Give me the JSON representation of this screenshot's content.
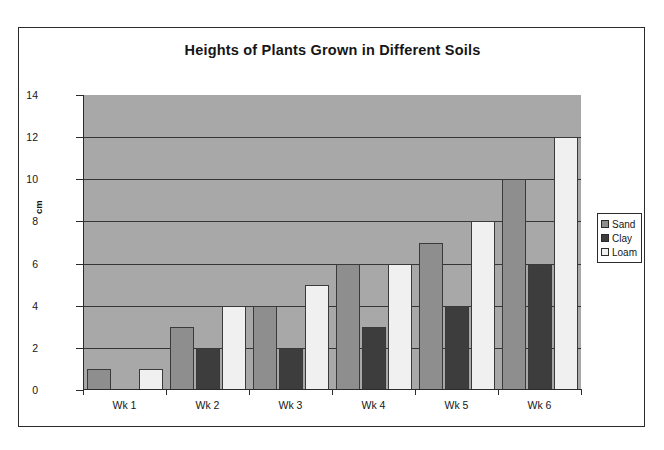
{
  "chart_data": {
    "type": "bar",
    "title": "Heights of Plants Grown in Different Soils",
    "xlabel": "",
    "ylabel": "cm",
    "categories": [
      "Wk 1",
      "Wk 2",
      "Wk 3",
      "Wk 4",
      "Wk 5",
      "Wk 6"
    ],
    "series": [
      {
        "name": "Sand",
        "color": "#8e8e8e",
        "values": [
          1,
          3,
          4,
          6,
          7,
          10
        ]
      },
      {
        "name": "Clay",
        "color": "#3d3d3d",
        "values": [
          0,
          2,
          2,
          3,
          4,
          6
        ]
      },
      {
        "name": "Loam",
        "color": "#f0f0f0",
        "values": [
          1,
          4,
          5,
          6,
          8,
          12
        ]
      }
    ],
    "ylim": [
      0,
      14
    ],
    "yticks": [
      0,
      2,
      4,
      6,
      8,
      10,
      12,
      14
    ],
    "grid": true,
    "legend_position": "right",
    "plot_background": "#a8a8a8",
    "axis_color": "#2b2b2b"
  },
  "legend": {
    "items": [
      {
        "label": "Sand"
      },
      {
        "label": "Clay"
      },
      {
        "label": "Loam"
      }
    ]
  }
}
